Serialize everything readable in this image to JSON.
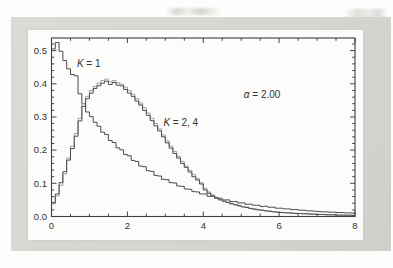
{
  "chart_data": {
    "type": "line",
    "subtype": "step-histogram",
    "title": "",
    "xlabel": "",
    "ylabel": "",
    "xlim": [
      0,
      8
    ],
    "ylim": [
      0,
      0.538
    ],
    "grid": false,
    "legend_position": "none",
    "frame_color": "#3f3f3f",
    "tick_color": "#454545",
    "text_color": "#333330",
    "x_major_ticks": [
      0,
      2,
      4,
      6,
      8
    ],
    "x_major_labels": [
      "0",
      "2",
      "4",
      "6",
      "8"
    ],
    "x_minor_ticks": [
      0.5,
      1,
      1.5,
      2.5,
      3,
      3.5,
      4.5,
      5,
      5.5,
      6.5,
      7,
      7.5
    ],
    "y_major_ticks": [
      0,
      0.1,
      0.2,
      0.3,
      0.4,
      0.5
    ],
    "y_major_labels": [
      "0.0",
      "0.1",
      "0.2",
      "0.3",
      "0.4",
      "0.5"
    ],
    "y_minor_ticks": [
      0.02,
      0.04,
      0.06,
      0.08,
      0.12,
      0.14,
      0.16,
      0.18,
      0.22,
      0.24,
      0.26,
      0.28,
      0.32,
      0.34,
      0.36,
      0.38,
      0.42,
      0.44,
      0.46,
      0.48,
      0.52
    ],
    "bin_width": 0.1,
    "annotations": [
      {
        "name": "k1-label",
        "var": "K",
        "rest": " = 1",
        "x": 0.67,
        "y": 0.452
      },
      {
        "name": "k24-label",
        "var": "K",
        "rest": " = 2, 4",
        "x": 2.95,
        "y": 0.272
      },
      {
        "name": "alpha-label",
        "var": "α",
        "rest": " = 2.00",
        "x": 5.07,
        "y": 0.358
      }
    ],
    "series": [
      {
        "name": "K = 1",
        "color": "#4b4b4b",
        "width": 1,
        "values": [
          0.505,
          0.524,
          0.498,
          0.47,
          0.445,
          0.428,
          0.424,
          0.37,
          0.34,
          0.315,
          0.301,
          0.284,
          0.272,
          0.254,
          0.247,
          0.229,
          0.223,
          0.207,
          0.201,
          0.187,
          0.183,
          0.169,
          0.166,
          0.152,
          0.15,
          0.138,
          0.136,
          0.124,
          0.122,
          0.112,
          0.111,
          0.102,
          0.101,
          0.092,
          0.091,
          0.083,
          0.082,
          0.075,
          0.074,
          0.068,
          0.068,
          0.061,
          0.061,
          0.055,
          0.055,
          0.05,
          0.05,
          0.045,
          0.045,
          0.041,
          0.041,
          0.037,
          0.037,
          0.034,
          0.034,
          0.03,
          0.031,
          0.028,
          0.028,
          0.025,
          0.025,
          0.023,
          0.023,
          0.021,
          0.021,
          0.019,
          0.019,
          0.017,
          0.017,
          0.016,
          0.015,
          0.014,
          0.014,
          0.013,
          0.013,
          0.012,
          0.012,
          0.011,
          0.011,
          0.01
        ]
      },
      {
        "name": "K = 4",
        "color": "#a3a19b",
        "width": 1,
        "values": [
          0.038,
          0.062,
          0.094,
          0.128,
          0.176,
          0.212,
          0.25,
          0.296,
          0.34,
          0.362,
          0.38,
          0.392,
          0.402,
          0.41,
          0.414,
          0.406,
          0.41,
          0.403,
          0.399,
          0.39,
          0.38,
          0.368,
          0.355,
          0.342,
          0.328,
          0.312,
          0.296,
          0.28,
          0.264,
          0.246,
          0.228,
          0.212,
          0.196,
          0.181,
          0.166,
          0.152,
          0.139,
          0.126,
          0.114,
          0.102,
          0.085,
          0.074,
          0.065,
          0.058,
          0.052,
          0.047,
          0.043,
          0.039,
          0.036,
          0.033,
          0.03,
          0.028,
          0.025,
          0.023,
          0.021,
          0.019,
          0.018,
          0.016,
          0.015,
          0.014,
          0.013,
          0.012,
          0.011,
          0.01,
          0.01,
          0.009,
          0.009,
          0.008,
          0.008,
          0.007,
          0.007,
          0.006,
          0.006,
          0.005,
          0.005,
          0.005,
          0.004,
          0.004,
          0.004,
          0.004
        ]
      },
      {
        "name": "K = 2",
        "color": "#4b4b4b",
        "width": 1,
        "values": [
          0.042,
          0.068,
          0.102,
          0.135,
          0.17,
          0.205,
          0.242,
          0.288,
          0.332,
          0.355,
          0.372,
          0.386,
          0.394,
          0.402,
          0.408,
          0.398,
          0.404,
          0.396,
          0.394,
          0.383,
          0.372,
          0.362,
          0.348,
          0.336,
          0.32,
          0.305,
          0.289,
          0.273,
          0.258,
          0.24,
          0.222,
          0.206,
          0.19,
          0.176,
          0.16,
          0.148,
          0.134,
          0.12,
          0.11,
          0.098,
          0.08,
          0.07,
          0.062,
          0.056,
          0.05,
          0.046,
          0.042,
          0.038,
          0.035,
          0.032,
          0.029,
          0.027,
          0.024,
          0.022,
          0.02,
          0.019,
          0.017,
          0.016,
          0.014,
          0.013,
          0.012,
          0.011,
          0.011,
          0.01,
          0.009,
          0.009,
          0.008,
          0.008,
          0.007,
          0.007,
          0.006,
          0.006,
          0.005,
          0.005,
          0.005,
          0.004,
          0.004,
          0.004,
          0.004,
          0.003
        ]
      }
    ]
  }
}
